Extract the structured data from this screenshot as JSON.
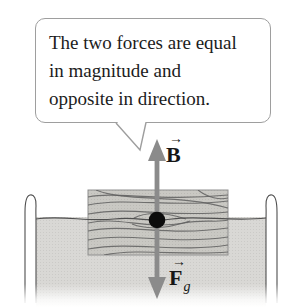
{
  "figure": {
    "callout": {
      "lines": [
        "The two forces are equal",
        "in magnitude and",
        "opposite in direction."
      ]
    },
    "labels": {
      "buoyant": {
        "vector_glyph": "→",
        "letter": "B"
      },
      "gravity": {
        "vector_glyph": "→",
        "letter": "F",
        "subscript": "g"
      }
    },
    "colors": {
      "arrow": "#8b8b8b",
      "water_fill": "#d9d8d5",
      "water_dot": "#cbcac7",
      "block_fill": "#c9c8c3",
      "block_dot": "#bbbab5",
      "grain": "#5f5f5f",
      "outline": "#4f4f4f",
      "bubble_border": "#9e9e9e",
      "dot": "#0c0c0c",
      "text": "#1c1c1c"
    }
  }
}
